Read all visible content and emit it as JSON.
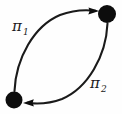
{
  "figure": {
    "type": "directed-graph-bigon",
    "background_color": "#fefefe",
    "stroke_color": "#1a1a1a",
    "node_fill_color": "#0d0d0d",
    "title": ""
  },
  "nodes": [
    {
      "id": "node-top-right",
      "label": "",
      "cx": 107,
      "cy": 14,
      "r": 9,
      "fill": "#0d0d0d"
    },
    {
      "id": "node-bottom-left",
      "label": "",
      "cx": 14,
      "cy": 100,
      "r": 8.5,
      "fill": "#0d0d0d"
    }
  ],
  "edges": [
    {
      "id": "edge-pi-1",
      "from": "node-bottom-left",
      "to": "node-top-right",
      "direction": "upward-left-arc",
      "arrowhead": "filled-triangle",
      "label_main": "π",
      "label_subscript": "1",
      "label_x": 18,
      "label_y": 30
    },
    {
      "id": "edge-pi-2",
      "from": "node-top-right",
      "to": "node-bottom-left",
      "direction": "downward-right-arc",
      "arrowhead": "filled-triangle",
      "label_main": "π",
      "label_subscript": "2",
      "label_x": 95,
      "label_y": 88
    }
  ],
  "labels": {
    "pi1": {
      "glyph": "π",
      "subscript": "1"
    },
    "pi2": {
      "glyph": "π",
      "subscript": "2"
    }
  }
}
